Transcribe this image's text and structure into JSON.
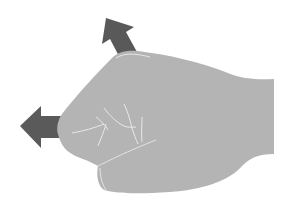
{
  "illustration": {
    "subject": "fist",
    "caption": "Closed fist with arrows indicating upward and leftward directions",
    "colors": {
      "background": "#ffffff",
      "hand_fill": "#b4b4b4",
      "hand_lines": "#e6e6e6",
      "arrow_fill": "#595959"
    },
    "arrows": [
      {
        "name": "up-left-arrow",
        "direction": "up-left"
      },
      {
        "name": "left-arrow",
        "direction": "left"
      }
    ]
  }
}
